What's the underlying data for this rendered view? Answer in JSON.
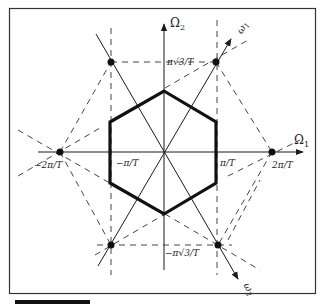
{
  "figure": {
    "type": "hexagonal sampling lattice in frequency domain",
    "colors": {
      "line": "#1a1a1a",
      "dashed": "#444444",
      "background": "#ffffff",
      "border": "#333333"
    },
    "axes": {
      "omega1_label": "Ω",
      "omega1_sub": "1",
      "omega2_label": "Ω",
      "omega2_sub": "2",
      "basis1_label": "ω",
      "basis1_sub": "1",
      "basis2_label": "ω",
      "basis2_sub": "2"
    },
    "tick_labels": {
      "pi_sqrt3_T": "π√3/T",
      "neg_pi_sqrt3_T": "−π√3/T",
      "pi_T": "π/T",
      "neg_pi_T": "−π/T",
      "two_pi_T": "2π/T",
      "neg_two_pi_T": "−2π/T"
    },
    "hexagon": {
      "description": "baseband spectral support region (thick outline)",
      "vertices": [
        [
          164,
          91
        ],
        [
          216,
          122
        ],
        [
          216,
          183
        ],
        [
          164,
          214
        ],
        [
          110,
          183
        ],
        [
          110,
          122
        ]
      ]
    },
    "lattice_points": [
      {
        "x": 111,
        "y": 62,
        "label": "(-π/T, π√3/T)"
      },
      {
        "x": 216,
        "y": 62,
        "label": "(π/T, π√3/T)"
      },
      {
        "x": 60,
        "y": 152,
        "label": "(-2π/T, 0)"
      },
      {
        "x": 272,
        "y": 152,
        "label": "(2π/T, 0)"
      },
      {
        "x": 111,
        "y": 245,
        "label": "(-π/T, -π√3/T)"
      },
      {
        "x": 218,
        "y": 245,
        "label": "(π/T, -π√3/T)"
      }
    ]
  }
}
